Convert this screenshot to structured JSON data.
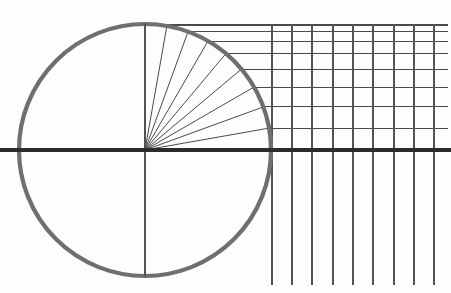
{
  "figure": {
    "type": "geometric-construction",
    "width": 451,
    "height": 293,
    "background_color": "#fdfdfd"
  },
  "colors": {
    "circle_stroke": "#6f6f6f",
    "axis_stroke": "#2b2b2b",
    "radius_stroke": "#4a4a4a",
    "grid_stroke": "#535353",
    "projection_stroke": "#4a4a4a",
    "background": "#fdfdfd"
  },
  "strokes": {
    "circle_width": 4.2,
    "axis_width": 3.4,
    "radius_width": 1.0,
    "grid_width": 1.3,
    "projection_width": 1.0
  },
  "circle": {
    "center_x": 145,
    "center_y": 150,
    "radius": 126,
    "label": "construction-circle"
  },
  "axes": {
    "horizontal": {
      "x1": 0,
      "y1": 150,
      "x2": 451,
      "y2": 150
    },
    "vertical": {
      "x1": 145,
      "y1": 24,
      "x2": 145,
      "y2": 276
    }
  },
  "quadrant": {
    "divisions": 9,
    "angle_step_degrees": 10,
    "start_angle_degrees": 0,
    "end_angle_degrees": 90
  },
  "chart_data": {
    "type": "line",
    "xlabel": "",
    "ylabel": "",
    "grid": true,
    "legend": "none",
    "angles_degrees": [
      0,
      10,
      20,
      30,
      40,
      50,
      60,
      70,
      80,
      90
    ],
    "sine_values": [
      0.0,
      0.1736,
      0.342,
      0.5,
      0.6428,
      0.766,
      0.866,
      0.9397,
      0.9848,
      1.0
    ],
    "radius_endpoints_px": [
      {
        "angle": 10,
        "x": 269.1,
        "y": 128.1
      },
      {
        "angle": 20,
        "x": 263.4,
        "y": 106.9
      },
      {
        "angle": 30,
        "x": 254.1,
        "y": 87.0
      },
      {
        "angle": 40,
        "x": 241.5,
        "y": 69.0
      },
      {
        "angle": 50,
        "x": 226.0,
        "y": 53.5
      },
      {
        "angle": 60,
        "x": 208.0,
        "y": 41.0
      },
      {
        "angle": 70,
        "x": 188.1,
        "y": 31.6
      },
      {
        "angle": 80,
        "x": 166.9,
        "y": 25.9
      }
    ],
    "projection_line_y_px": [
      128.1,
      106.9,
      87.0,
      69.0,
      53.5,
      41.0,
      31.6,
      25.9,
      24.0
    ],
    "vertical_grid_x_px": [
      272,
      292,
      312,
      333,
      353,
      373,
      394,
      414,
      434
    ],
    "vertical_grid_top_y": 24,
    "vertical_grid_bottom_y": 285,
    "projection_x_end": 448
  }
}
